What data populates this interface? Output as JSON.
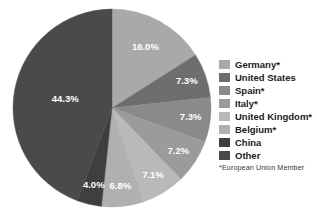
{
  "chart_data": {
    "type": "pie",
    "title": "",
    "subtitle": "",
    "xlabel": "",
    "ylabel": "",
    "legend_position": "right",
    "grid": false,
    "start_angle_deg": 0,
    "direction": "clockwise",
    "unit": "%",
    "categories": [
      "Germany*",
      "United States",
      "Spain*",
      "Italy*",
      "United Kingdom*",
      "Belgium*",
      "China",
      "Other"
    ],
    "values": [
      16.0,
      7.3,
      7.3,
      7.2,
      7.1,
      6.8,
      4.0,
      44.3
    ],
    "data_labels": [
      "16.0%",
      "7.3%",
      "7.3%",
      "7.2%",
      "7.1%",
      "6.8%",
      "4.0%",
      "44.3%"
    ],
    "colors": [
      "#a9a9a9",
      "#6e6e6e",
      "#8a8a8a",
      "#9b9b9b",
      "#b9b9b9",
      "#b0b0b0",
      "#3f3f3f",
      "#4a4a4a"
    ],
    "annotations": [
      "*European Union Member"
    ],
    "slices": [
      {
        "label": "Germany*",
        "value": 16.0,
        "data_label": "16.0%",
        "color": "#a9a9a9"
      },
      {
        "label": "United States",
        "value": 7.3,
        "data_label": "7.3%",
        "color": "#6e6e6e"
      },
      {
        "label": "Spain*",
        "value": 7.3,
        "data_label": "7.3%",
        "color": "#8a8a8a"
      },
      {
        "label": "Italy*",
        "value": 7.2,
        "data_label": "7.2%",
        "color": "#9b9b9b"
      },
      {
        "label": "United Kingdom*",
        "value": 7.1,
        "data_label": "7.1%",
        "color": "#b9b9b9"
      },
      {
        "label": "Belgium*",
        "value": 6.8,
        "data_label": "6.8%",
        "color": "#b0b0b0"
      },
      {
        "label": "China",
        "value": 4.0,
        "data_label": "4.0%",
        "color": "#3f3f3f"
      },
      {
        "label": "Other",
        "value": 44.3,
        "data_label": "44.3%",
        "color": "#4a4a4a"
      }
    ]
  },
  "legend": {
    "items": [
      {
        "label": "Germany*",
        "color": "#a9a9a9"
      },
      {
        "label": "United States",
        "color": "#6e6e6e"
      },
      {
        "label": "Spain*",
        "color": "#8a8a8a"
      },
      {
        "label": "Italy*",
        "color": "#9b9b9b"
      },
      {
        "label": "United Kingdom*",
        "color": "#b9b9b9"
      },
      {
        "label": "Belgium*",
        "color": "#b0b0b0"
      },
      {
        "label": "China",
        "color": "#3f3f3f"
      },
      {
        "label": "Other",
        "color": "#4a4a4a"
      }
    ],
    "footnote": "*European Union Member"
  }
}
